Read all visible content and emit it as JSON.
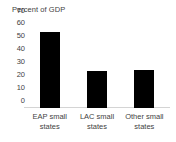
{
  "chart_data": {
    "type": "bar",
    "title": "Percent of GDP",
    "xlabel": "",
    "ylabel": "",
    "categories": [
      "EAP small states",
      "LAC small states",
      "Other small states"
    ],
    "values": [
      59,
      29,
      29.5
    ],
    "ylim": [
      0,
      70
    ],
    "yticks": [
      "0",
      "10",
      "20",
      "30",
      "40",
      "50",
      "60",
      "70"
    ],
    "ytick_values": [
      0,
      10,
      20,
      30,
      40,
      50,
      60,
      70
    ],
    "grid": false,
    "legend": "none",
    "bar_color": "#000000",
    "axis_color": "#d4d4d4",
    "text_color": "#3f3f3f",
    "background_color": "#ffffff"
  }
}
